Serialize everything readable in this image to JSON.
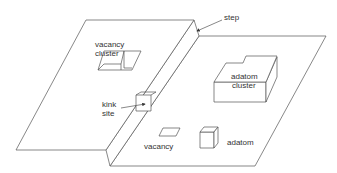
{
  "diagram": {
    "type": "surface-defects-schematic",
    "line_color": "#555555",
    "text_color": "#333333",
    "labels": {
      "step": "step",
      "vacancy_cluster_1": "vacancy",
      "vacancy_cluster_2": "cluster",
      "kink_site_1": "kink",
      "kink_site_2": "site",
      "adatom_cluster_1": "adatom",
      "adatom_cluster_2": "cluster",
      "vacancy": "vacancy",
      "adatom": "adatom"
    }
  }
}
